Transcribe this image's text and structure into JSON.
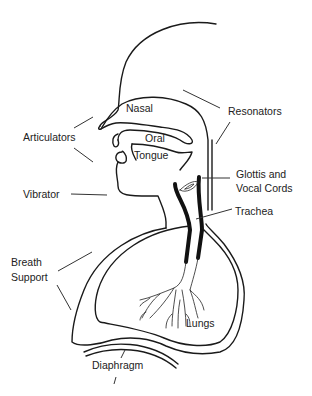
{
  "diagram": {
    "labels": {
      "nasal": "Nasal",
      "oral": "Oral",
      "tongue": "Tongue",
      "resonators": "Resonators",
      "articulators": "Articulators",
      "glottis_line1": "Glottis and",
      "glottis_line2": "Vocal Cords",
      "vibrator": "Vibrator",
      "trachea": "Trachea",
      "breath_line1": "Breath",
      "breath_line2": "Support",
      "lungs": "Lungs",
      "diaphragm": "Diaphragm"
    }
  }
}
